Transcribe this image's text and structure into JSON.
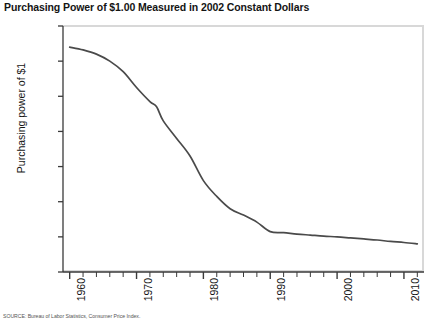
{
  "chart_data": {
    "type": "line",
    "title": "Purchasing Power of $1.00 Measured in 2002 Constant Dollars",
    "xlabel": "",
    "ylabel": "Purchasing power of $1",
    "xlim": [
      1959,
      2013
    ],
    "ylim": [
      0.0,
      7.0
    ],
    "grid": false,
    "legend": null,
    "x_ticks": [
      "1960",
      "1970",
      "1980",
      "1990",
      "2000",
      "2010"
    ],
    "x_tick_values": [
      1960,
      1970,
      1980,
      1990,
      2000,
      2010
    ],
    "x_minor_tick_interval": 2,
    "y_ticks": [
      "$7.00",
      "6.00",
      "5.00",
      "4.00",
      "3.00",
      "2.00",
      "1.00",
      "0.00"
    ],
    "y_tick_values": [
      7.0,
      6.0,
      5.0,
      4.0,
      3.0,
      2.0,
      1.0,
      0.0
    ],
    "line_color": "#4a4a4a",
    "series": [
      {
        "name": "Purchasing power of $1",
        "x": [
          1960,
          1962,
          1964,
          1966,
          1968,
          1970,
          1972,
          1973,
          1974,
          1976,
          1978,
          1980,
          1982,
          1984,
          1986,
          1988,
          1990,
          1992,
          1994,
          1996,
          1998,
          2000,
          2002,
          2004,
          2006,
          2008,
          2010,
          2012
        ],
        "values": [
          6.4,
          6.32,
          6.2,
          6.0,
          5.7,
          5.25,
          4.85,
          4.7,
          4.3,
          3.8,
          3.3,
          2.6,
          2.15,
          1.8,
          1.62,
          1.42,
          1.15,
          1.12,
          1.08,
          1.05,
          1.02,
          1.0,
          0.97,
          0.94,
          0.91,
          0.87,
          0.84,
          0.8
        ]
      }
    ]
  },
  "source_note": "SOURCE: Bureau of Labor Statistics, Consumer Price Index."
}
